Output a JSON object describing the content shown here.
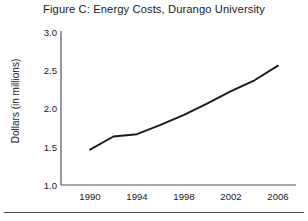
{
  "figure": {
    "title": "Figure C: Energy Costs, Durango University"
  },
  "axes": {
    "y_title": "Dollars (in millions)",
    "y_ticks": [
      "3.0",
      "2.5",
      "2.0",
      "1.5",
      "1.0"
    ],
    "x_ticks": [
      "1990",
      "1994",
      "1998",
      "2002",
      "2006"
    ]
  },
  "colors": {
    "line": "#1a1a1a",
    "axis": "#555555",
    "background": "#ffffff",
    "rule": "#4a4a4a"
  },
  "chart_data": {
    "type": "line",
    "title": "Figure C: Energy Costs, Durango University",
    "xlabel": "",
    "ylabel": "Dollars (in millions)",
    "xlim": [
      1989,
      2006.5
    ],
    "ylim": [
      1.0,
      3.0
    ],
    "grid": false,
    "legend": "none",
    "x": [
      1990,
      1992,
      1994,
      1996,
      1998,
      2000,
      2002,
      2004,
      2006
    ],
    "series": [
      {
        "name": "Energy costs",
        "values": [
          1.46,
          1.63,
          1.66,
          1.78,
          1.91,
          2.06,
          2.22,
          2.36,
          2.55
        ]
      }
    ],
    "x_tick_values": [
      1990,
      1994,
      1998,
      2002,
      2006
    ],
    "y_tick_values": [
      1.0,
      1.5,
      2.0,
      2.5,
      3.0
    ]
  }
}
